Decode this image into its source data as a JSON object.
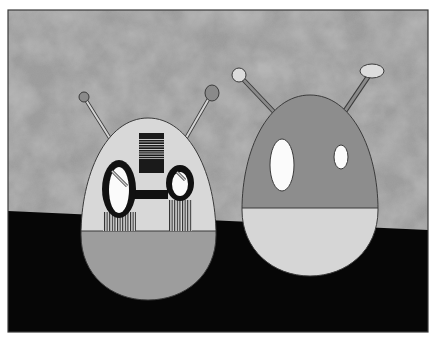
{
  "scene": {
    "description": "Grayscale illustration of two egg-shaped robot figures with antennae standing in front of a mottled gray wall on a black floor",
    "frame": {
      "x": 8,
      "y": 10,
      "width": 420,
      "height": 322,
      "border_color": "#3a3a3a"
    },
    "colors": {
      "wall": "#9a9a9a",
      "wall_dark": "#7e7e7e",
      "wall_light": "#b2b2b2",
      "floor": "#060606",
      "outline": "#3b3b3b",
      "light_gray": "#d8d8d8",
      "mid_gray": "#9c9c9c",
      "dark_gray": "#8c8c8c",
      "white": "#fbfbfb",
      "goggle_black": "#111111"
    },
    "floor_line": {
      "left_y": 211,
      "right_y": 230
    },
    "robots": [
      {
        "name": "left-robot",
        "body": {
          "cx": 148,
          "top": 118,
          "bottom": 300,
          "half_width": 68,
          "split_y": 231,
          "upper_color": "#d8d8d8",
          "lower_color": "#9d9d9d"
        },
        "antennae": [
          {
            "ball": {
              "cx": 84,
              "cy": 97,
              "rx": 5,
              "ry": 5,
              "color": "#8a8a8a"
            },
            "stick_end": {
              "x": 111,
              "y": 140
            }
          },
          {
            "ball": {
              "cx": 212,
              "cy": 93,
              "rx": 7,
              "ry": 8,
              "color": "#8a8a8a"
            },
            "stick_end": {
              "x": 186,
              "y": 138
            }
          }
        ],
        "barcode_box": {
          "x": 139,
          "y": 133,
          "width": 25,
          "height": 40
        },
        "goggles": [
          {
            "cx": 119,
            "cy": 189,
            "rx": 17,
            "ry": 29,
            "inner_rx": 10,
            "inner_ry": 23
          },
          {
            "cx": 180,
            "cy": 183,
            "rx": 14,
            "ry": 18,
            "inner_rx": 8,
            "inner_ry": 12
          }
        ],
        "bridge": {
          "x": 133,
          "y": 190,
          "width": 34,
          "height": 9
        }
      },
      {
        "name": "right-robot",
        "body": {
          "cx": 310,
          "top": 95,
          "bottom": 276,
          "half_width": 68,
          "split_y": 208,
          "upper_color": "#8d8d8d",
          "lower_color": "#d6d6d6"
        },
        "antennae": [
          {
            "ball": {
              "cx": 239,
              "cy": 75,
              "rx": 7,
              "ry": 7,
              "color": "#dcdcdc"
            },
            "stick_end": {
              "x": 275,
              "y": 112
            }
          },
          {
            "ball": {
              "cx": 372,
              "cy": 72,
              "rx": 12,
              "ry": 7,
              "color": "#dcdcdc"
            },
            "stick_end": {
              "x": 346,
              "y": 110
            }
          }
        ],
        "eyes": [
          {
            "cx": 282,
            "cy": 165,
            "rx": 12,
            "ry": 26
          },
          {
            "cx": 341,
            "cy": 157,
            "rx": 7,
            "ry": 12
          }
        ]
      }
    ]
  }
}
